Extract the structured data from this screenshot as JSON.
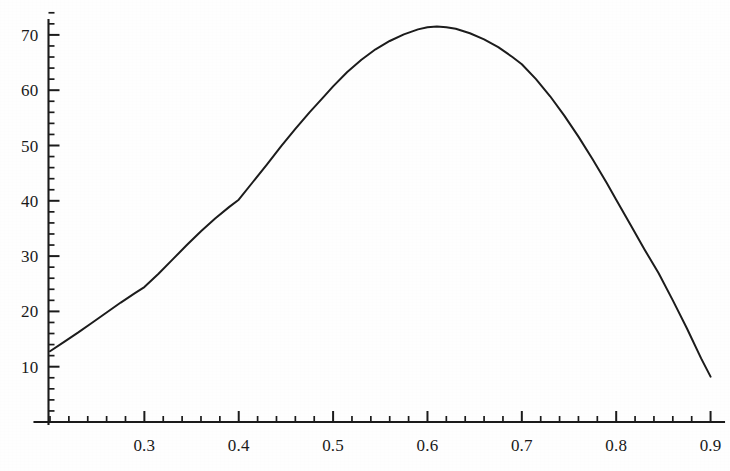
{
  "chart_data": {
    "type": "line",
    "title": "",
    "subtitle": "",
    "xlabel": "",
    "ylabel": "",
    "xlim": [
      0.2,
      0.91
    ],
    "ylim": [
      0,
      74
    ],
    "grid": false,
    "legend": null,
    "x_ticks": [
      0.3,
      0.4,
      0.5,
      0.6,
      0.7,
      0.8,
      0.9
    ],
    "x_tick_labels": [
      "0.3",
      "0.4",
      "0.5",
      "0.6",
      "0.7",
      "0.8",
      "0.9"
    ],
    "x_minor_step": 0.02,
    "y_ticks": [
      10,
      20,
      30,
      40,
      50,
      60,
      70
    ],
    "y_tick_labels": [
      "10",
      "20",
      "30",
      "40",
      "50",
      "60",
      "70"
    ],
    "y_minor_step": 2,
    "line_color": "#1c1c1c",
    "background_color": "#fefefe",
    "series": [
      {
        "name": "curve",
        "x": [
          0.2,
          0.215,
          0.23,
          0.245,
          0.26,
          0.275,
          0.29,
          0.3,
          0.315,
          0.33,
          0.345,
          0.36,
          0.375,
          0.39,
          0.4,
          0.415,
          0.43,
          0.445,
          0.46,
          0.475,
          0.49,
          0.5,
          0.515,
          0.53,
          0.545,
          0.56,
          0.575,
          0.59,
          0.6,
          0.61,
          0.62,
          0.63,
          0.645,
          0.66,
          0.675,
          0.69,
          0.7,
          0.715,
          0.73,
          0.745,
          0.76,
          0.775,
          0.79,
          0.8,
          0.815,
          0.83,
          0.845,
          0.86,
          0.875,
          0.89,
          0.9
        ],
        "y": [
          12.8,
          14.5,
          16.2,
          18.0,
          19.8,
          21.6,
          23.3,
          24.4,
          26.8,
          29.4,
          32.0,
          34.5,
          36.8,
          38.9,
          40.2,
          43.4,
          46.6,
          49.9,
          53.0,
          56.0,
          58.8,
          60.7,
          63.3,
          65.5,
          67.4,
          68.9,
          70.1,
          71.0,
          71.4,
          71.5,
          71.4,
          71.1,
          70.3,
          69.2,
          67.8,
          66.0,
          64.7,
          62.0,
          58.9,
          55.4,
          51.6,
          47.5,
          43.2,
          40.2,
          35.7,
          31.2,
          26.9,
          22.0,
          16.9,
          11.5,
          8.2
        ]
      }
    ]
  },
  "axes": {
    "y_axis_name": "vertical-value-axis",
    "x_axis_name": "horizontal-value-axis"
  }
}
